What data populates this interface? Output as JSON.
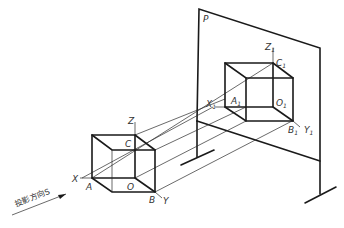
{
  "diagram": {
    "plane_label": "P",
    "direction_label": "投影方向S",
    "object_labels": {
      "X": "X",
      "Y": "Y",
      "Z": "Z",
      "A": "A",
      "B": "B",
      "C": "C",
      "O": "O"
    },
    "projection_labels": {
      "X1": "X",
      "Y1": "Y",
      "Z1": "Z",
      "A1": "A",
      "B1": "B",
      "C1": "C",
      "O1": "O",
      "subscript": "1"
    },
    "colors": {
      "line": "#1a1a1a",
      "background": "#ffffff"
    }
  }
}
